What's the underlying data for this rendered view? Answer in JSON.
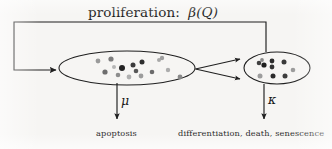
{
  "diagram": {
    "type": "flow-diagram",
    "background_color": "#f6f5f3",
    "stroke_color": "#1f1f1f",
    "title": {
      "prefix": "proliferation:",
      "symbol": "β(Q)",
      "symbol_plain": "beta(Q)"
    },
    "nodes": [
      {
        "id": "proliferating-pool",
        "name": "left-cell-population",
        "shape": "ellipse",
        "cx": 127,
        "cy": 68,
        "rx": 68,
        "ry": 17,
        "dots": [
          {
            "x": 98,
            "y": 61,
            "r": 2.4,
            "color": "#9a9a9a"
          },
          {
            "x": 111,
            "y": 59,
            "r": 2.6,
            "color": "#7d7d7d"
          },
          {
            "x": 105,
            "y": 72,
            "r": 2.6,
            "color": "#6e6e6e"
          },
          {
            "x": 118,
            "y": 75,
            "r": 2.3,
            "color": "#8d8d8d"
          },
          {
            "x": 122,
            "y": 68,
            "r": 3.0,
            "color": "#232323"
          },
          {
            "x": 133,
            "y": 65,
            "r": 2.5,
            "color": "#3b3b3b"
          },
          {
            "x": 136,
            "y": 71,
            "r": 2.3,
            "color": "#575757"
          },
          {
            "x": 142,
            "y": 62,
            "r": 2.5,
            "color": "#2e2e2e"
          },
          {
            "x": 129,
            "y": 77,
            "r": 2.4,
            "color": "#b0b0b0"
          },
          {
            "x": 141,
            "y": 76,
            "r": 2.4,
            "color": "#9c9c9c"
          },
          {
            "x": 152,
            "y": 72,
            "r": 2.3,
            "color": "#6b6b6b"
          },
          {
            "x": 159,
            "y": 60,
            "r": 2.0,
            "color": "#a8a8a8"
          },
          {
            "x": 162,
            "y": 58,
            "r": 2.2,
            "color": "#9f9f9f"
          },
          {
            "x": 168,
            "y": 70,
            "r": 2.2,
            "color": "#adadad"
          },
          {
            "x": 180,
            "y": 77,
            "r": 2.4,
            "color": "#8a8a8a"
          },
          {
            "x": 114,
            "y": 67,
            "r": 2.0,
            "color": "#b5b5b5"
          }
        ]
      },
      {
        "id": "terminal-pool",
        "name": "right-cell-population",
        "shape": "ellipse",
        "cx": 277,
        "cy": 68,
        "rx": 33,
        "ry": 16,
        "dots": [
          {
            "x": 259,
            "y": 63,
            "r": 2.3,
            "color": "#404040"
          },
          {
            "x": 264,
            "y": 65,
            "r": 2.6,
            "color": "#1e1e1e"
          },
          {
            "x": 262,
            "y": 60,
            "r": 1.9,
            "color": "#8a8a8a"
          },
          {
            "x": 272,
            "y": 61,
            "r": 2.4,
            "color": "#2b2b2b"
          },
          {
            "x": 272,
            "y": 67,
            "r": 2.4,
            "color": "#333333"
          },
          {
            "x": 284,
            "y": 62,
            "r": 2.5,
            "color": "#3a3a3a"
          },
          {
            "x": 260,
            "y": 76,
            "r": 2.5,
            "color": "#9d9d9d"
          },
          {
            "x": 273,
            "y": 76,
            "r": 2.5,
            "color": "#2a2a2a"
          },
          {
            "x": 285,
            "y": 76,
            "r": 2.5,
            "color": "#3d3d3d"
          },
          {
            "x": 293,
            "y": 70,
            "r": 2.3,
            "color": "#9b9b9b"
          }
        ]
      }
    ],
    "edges": [
      {
        "id": "proliferation-feedback",
        "name": "proliferation-feedback-loop",
        "from": "terminal-pool-top",
        "to": "proliferating-pool-left",
        "path": "M 266 52 L 266 22 L 14 22 L 14 70 L 57 70",
        "arrowhead": "end"
      },
      {
        "id": "transition-upper",
        "name": "transition-arrow-upper",
        "from": "proliferating-pool-right",
        "to": "terminal-pool-left",
        "path": "M 195 69 L 242 59",
        "arrowhead": "end"
      },
      {
        "id": "transition-lower",
        "name": "transition-arrow-lower",
        "from": "proliferating-pool-right",
        "to": "terminal-pool-left",
        "path": "M 195 69 L 242 79",
        "arrowhead": "end"
      },
      {
        "id": "apoptosis-flux",
        "name": "apoptosis-arrow",
        "from": "proliferating-pool-bottom",
        "to": "apoptosis-label",
        "path": "M 117 83 L 117 121",
        "arrowhead": "end",
        "rate_symbol": "μ",
        "rate_symbol_plain": "mu"
      },
      {
        "id": "removal-flux",
        "name": "removal-arrow",
        "from": "terminal-pool-bottom",
        "to": "removal-label",
        "path": "M 264 84 L 264 121",
        "arrowhead": "end",
        "rate_symbol": "κ",
        "rate_symbol_plain": "kappa"
      }
    ],
    "labels": [
      {
        "id": "apoptosis-label",
        "name": "apoptosis-caption",
        "text": "apoptosis",
        "x": 124,
        "y": 132
      },
      {
        "id": "removal-label",
        "name": "differentiation-death-senescence-caption",
        "text": "differentiation, death, senescence",
        "x": 253,
        "y": 132
      }
    ],
    "rate_labels": [
      {
        "id": "mu-label",
        "name": "mu-rate-label",
        "text": "μ",
        "x": 123,
        "y": 103
      },
      {
        "id": "kappa-label",
        "name": "kappa-rate-label",
        "text": "κ",
        "x": 270,
        "y": 101
      }
    ]
  }
}
